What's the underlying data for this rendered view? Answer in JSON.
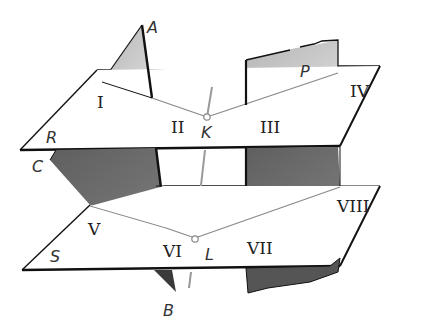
{
  "diagram": {
    "type": "stereometry",
    "colors": {
      "plane_fill": "#ffffff",
      "plane_edge": "#111111",
      "upper_shade": "#c4c4c4",
      "lower_shade": "#6e6e6e",
      "line_gray": "#999999"
    },
    "labels": {
      "point_a": "A",
      "point_b": "B",
      "point_c": "C",
      "point_k": "K",
      "point_l": "L",
      "plane_p": "P",
      "plane_r": "R",
      "plane_s": "S",
      "region_1": "I",
      "region_2": "II",
      "region_3": "III",
      "region_4": "IV",
      "region_5": "V",
      "region_6": "VI",
      "region_7": "VII",
      "region_8": "VIII"
    }
  }
}
